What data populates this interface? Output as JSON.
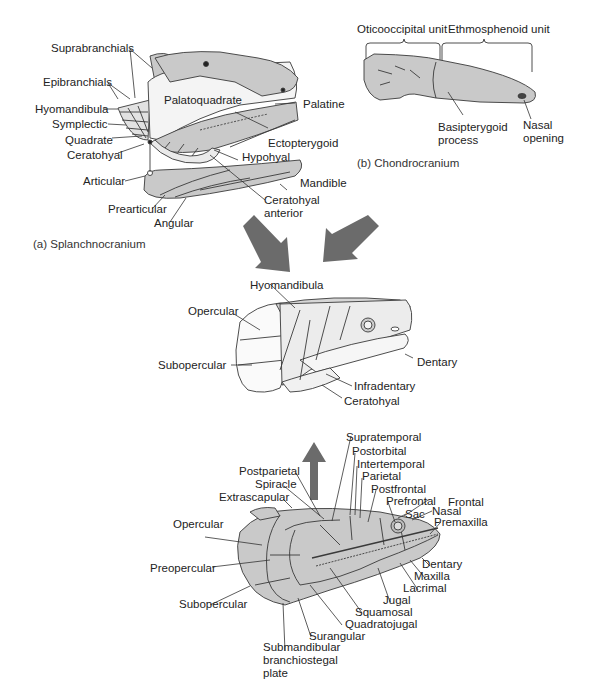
{
  "figure": {
    "panels": {
      "splanchnocranium": {
        "caption": "(a) Splanchnocranium",
        "labels": {
          "suprabranchials": "Suprabranchials",
          "epibranchials": "Epibranchials",
          "hyomandibula": "Hyomandibula",
          "symplectic": "Symplectic",
          "quadrate": "Quadrate",
          "ceratohyal": "Ceratohyal",
          "articular": "Articular",
          "prearticular": "Prearticular",
          "angular": "Angular",
          "palatoquadrate": "Palatoquadrate",
          "palatine": "Palatine",
          "ectopterygoid": "Ectopterygoid",
          "hypohyal": "Hypohyal",
          "mandible": "Mandible",
          "ceratohyal_anterior_1": "Ceratohyal",
          "ceratohyal_anterior_2": "anterior"
        }
      },
      "chondrocranium": {
        "caption": "(b) Chondrocranium",
        "labels": {
          "oticooccipital": "Oticooccipital unit",
          "ethmosphenoid": "Ethmosphenoid unit",
          "basipterygoid_1": "Basipterygoid",
          "basipterygoid_2": "process",
          "nasal_1": "Nasal",
          "nasal_2": "opening"
        }
      },
      "combined": {
        "labels": {
          "hyomandibula": "Hyomandibula",
          "opercular": "Opercular",
          "subopercular": "Subopercular",
          "dentary": "Dentary",
          "infradentary": "Infradentary",
          "ceratohyal": "Ceratohyal"
        }
      },
      "dermatocranium": {
        "labels": {
          "supratemporal": "Supratemporal",
          "postorbital": "Postorbital",
          "intertemporal": "Intertemporal",
          "parietal": "Parietal",
          "postfrontal": "Postfrontal",
          "prefrontal": "Prefrontal",
          "frontal": "Frontal",
          "postparietal": "Postparietal",
          "spiracle": "Spiracle",
          "extrascapular": "Extrascapular",
          "sac": "Sac",
          "nasal": "Nasal",
          "premaxilla": "Premaxilla",
          "opercular": "Opercular",
          "preopercular": "Preopercular",
          "subopercular": "Subopercular",
          "dentary": "Dentary",
          "maxilla": "Maxilla",
          "lacrimal": "Lacrimal",
          "jugal": "Jugal",
          "squamosal": "Squamosal",
          "quadratojugal": "Quadratojugal",
          "surangular": "Surangular",
          "submandibular_1": "Submandibular",
          "submandibular_2": "branchiostegal",
          "submandibular_3": "plate"
        }
      }
    },
    "colors": {
      "bone_fill": "#c9c9c9",
      "light_fill": "#ececec",
      "outline": "#3a3a3a",
      "arrow": "#6b6b6b",
      "leader": "#333333"
    }
  }
}
